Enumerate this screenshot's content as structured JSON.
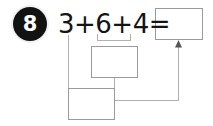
{
  "worksheet": {
    "problem_number": "8",
    "equation": "3+6+4=",
    "addends": [
      3,
      6,
      4
    ],
    "operator": "+",
    "equals_sign": "=",
    "strategy": "make-a-ten grouping: 6 and 4 are bracketed together into an intermediate box, 3 is carried down to a second box, and both feed the final sum box",
    "colors": {
      "badge_fill": "#121212",
      "badge_text": "#ffffff",
      "equation_text": "#141414",
      "box_border": "#9a9a9a",
      "connector_line": "#b0b0b0",
      "arrow_fill": "#555555",
      "page_background": "#ffffff"
    },
    "boxes": [
      {
        "id": "box-sum",
        "name": "final-answer-box",
        "value": "",
        "placeholder": ""
      },
      {
        "id": "box-mid",
        "name": "partial-sum-box-middle",
        "value": "",
        "placeholder": ""
      },
      {
        "id": "box-left",
        "name": "partial-sum-box-bottom",
        "value": "",
        "placeholder": ""
      }
    ],
    "connectors": [
      {
        "name": "bracket-from-6-and-4-to-middle-box",
        "type": "bracket"
      },
      {
        "name": "line-from-3-to-bottom-box",
        "type": "elbow"
      },
      {
        "name": "line-from-middle-box-to-bottom-box",
        "type": "elbow"
      },
      {
        "name": "arrow-to-final-answer-box",
        "type": "arrow"
      }
    ]
  }
}
